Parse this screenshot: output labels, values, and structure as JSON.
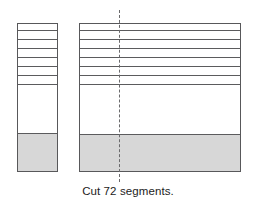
{
  "figure": {
    "caption": "Cut 72 segments.",
    "colors": {
      "outline": "#58585a",
      "cut_line": "#5b5b5d",
      "shaded_fill": "#d7d7d7",
      "plain_fill": "#ffffff",
      "background": "#ffffff",
      "dash_line": "#6a6a6c",
      "caption_text": "#1c1c1c"
    },
    "canvas": {
      "width": 256,
      "height": 205
    }
  },
  "center_dash_line": {
    "label": "cut-position-guide",
    "x": 119,
    "top": 10,
    "bottom": 182
  },
  "bars": [
    {
      "id": "left-bar",
      "label": "narrow-bar",
      "x": 17,
      "y": 23,
      "width": 41,
      "height": 149,
      "striped_zone": {
        "top": 0,
        "height": 68,
        "cut_line_count": 8
      },
      "cut_line_offsets": [
        6,
        15,
        24,
        33,
        42,
        51,
        60,
        68
      ],
      "plain_zone": {
        "top": 68,
        "height": 41
      },
      "shaded_zone": {
        "top": 109,
        "height": 40
      }
    },
    {
      "id": "right-bar",
      "label": "wide-bar",
      "x": 79,
      "y": 23,
      "width": 162,
      "height": 149,
      "striped_zone": {
        "top": 0,
        "height": 68,
        "cut_line_count": 8
      },
      "cut_line_offsets": [
        6,
        15,
        24,
        33,
        42,
        51,
        60,
        68
      ],
      "plain_zone": {
        "top": 68,
        "height": 42
      },
      "shaded_zone": {
        "top": 110,
        "height": 39
      }
    }
  ],
  "caption": {
    "text": "Cut 72 segments.",
    "x": 0,
    "y": 185
  }
}
